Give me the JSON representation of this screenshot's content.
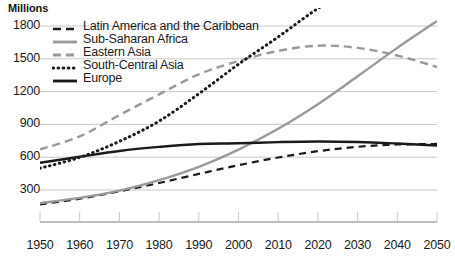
{
  "chart_data": {
    "type": "line",
    "title": "",
    "ylabel": "Millions",
    "xlabel": "",
    "ylim": [
      0,
      1900
    ],
    "xlim": [
      1950,
      2050
    ],
    "grid": true,
    "legend_position": "top-left",
    "y_ticks": [
      300,
      600,
      900,
      1200,
      1500,
      1800
    ],
    "x_ticks": [
      1950,
      1960,
      1970,
      1980,
      1990,
      2000,
      2010,
      2020,
      2030,
      2040,
      2050
    ],
    "x": [
      1950,
      1960,
      1970,
      1980,
      1990,
      2000,
      2010,
      2020,
      2030,
      2040,
      2050
    ],
    "series": [
      {
        "name": "Latin America and the Caribbean",
        "style": "dashed",
        "color": "#1a1a1a",
        "width": 2.2,
        "dash": "7,5",
        "values": [
          169,
          220,
          288,
          364,
          447,
          527,
          597,
          655,
          695,
          716,
          721
        ]
      },
      {
        "name": "Sub-Saharan Africa",
        "style": "solid",
        "color": "#9a9a9a",
        "width": 2.4,
        "dash": "",
        "values": [
          180,
          228,
          294,
          390,
          512,
          670,
          860,
          1085,
          1340,
          1600,
          1845
        ]
      },
      {
        "name": "Eastern Asia",
        "style": "dashed",
        "color": "#9a9a9a",
        "width": 2.4,
        "dash": "8,5",
        "values": [
          671,
          790,
          985,
          1175,
          1358,
          1480,
          1572,
          1620,
          1600,
          1530,
          1425
        ]
      },
      {
        "name": "South-Central Asia",
        "style": "dotted",
        "color": "#1a1a1a",
        "width": 3.0,
        "dash": "0.5,4.5",
        "values": [
          499,
          598,
          745,
          930,
          1180,
          1450,
          1700,
          1960,
          2170,
          2310,
          2380
        ]
      },
      {
        "name": "Europe",
        "style": "solid",
        "color": "#1a1a1a",
        "width": 2.4,
        "dash": "",
        "values": [
          549,
          604,
          657,
          694,
          721,
          727,
          738,
          744,
          739,
          725,
          707
        ]
      }
    ]
  },
  "legend": {
    "items": [
      {
        "label": "Latin America and the Caribbean",
        "key": "latin-america"
      },
      {
        "label": "Sub-Saharan Africa",
        "key": "sub-saharan-africa"
      },
      {
        "label": "Eastern Asia",
        "key": "eastern-asia"
      },
      {
        "label": "South-Central Asia",
        "key": "south-central-asia"
      },
      {
        "label": "Europe",
        "key": "europe"
      }
    ]
  },
  "axes": {
    "y_title": "Millions",
    "y_tick_labels": [
      "1800",
      "1500",
      "1200",
      "900",
      "600",
      "300"
    ],
    "x_tick_labels": [
      "1950",
      "1960",
      "1970",
      "1980",
      "1990",
      "2000",
      "2010",
      "2020",
      "2030",
      "2040",
      "2050"
    ]
  },
  "colors": {
    "grid": "#c8c8c8",
    "axis": "#808080",
    "dark_series": "#1a1a1a",
    "gray_series": "#9a9a9a",
    "text": "#1a1a1a"
  },
  "footnote": ""
}
